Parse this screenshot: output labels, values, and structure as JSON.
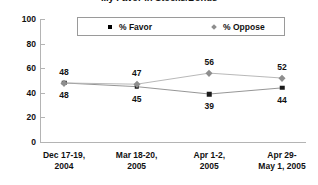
{
  "chart_data": {
    "type": "line",
    "title": "...y Favor in Stocks/Bonds",
    "xlabel": "",
    "ylabel": "",
    "ylim": [
      0,
      100
    ],
    "yticks": [
      "0",
      "20",
      "40",
      "60",
      "80",
      "100"
    ],
    "grid": false,
    "legend_position": "top-center",
    "categories": [
      {
        "line1": "Dec 17-19,",
        "line2": "2004"
      },
      {
        "line1": "Mar 18-20,",
        "line2": "2005"
      },
      {
        "line1": "Apr 1-2,",
        "line2": "2005"
      },
      {
        "line1": "Apr 29-",
        "line2": "May 1, 2005"
      }
    ],
    "series": [
      {
        "name": "% Favor",
        "marker": "square",
        "color": "#1a1a1a",
        "values": [
          48,
          45,
          39,
          44
        ],
        "labels": [
          "48",
          "45",
          "39",
          "44"
        ],
        "label_position": "below"
      },
      {
        "name": "% Oppose",
        "marker": "diamond",
        "color": "#8e8e8e",
        "values": [
          48,
          47,
          56,
          52
        ],
        "labels": [
          "48",
          "47",
          "56",
          "52"
        ],
        "label_position": "above"
      }
    ]
  },
  "legend": {
    "favor_label": "% Favor",
    "oppose_label": "% Oppose"
  },
  "colors": {
    "favor": "#1a1a1a",
    "oppose": "#8e8e8e",
    "axis": "#b4b4b4",
    "text": "#111111"
  }
}
